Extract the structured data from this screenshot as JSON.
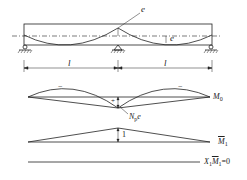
{
  "diagram": {
    "type": "prestressed-continuous-beam-moment-diagrams",
    "colors": {
      "stroke": "#222222",
      "background": "#ffffff"
    },
    "beam": {
      "eccentricity_label_top": "e",
      "eccentricity_label_span": "e",
      "supports": 3,
      "span_labels": [
        "l",
        "l"
      ]
    },
    "m0_diagram": {
      "label_main": "M",
      "label_sub": "0",
      "sign_negative_left": "−",
      "sign_negative_right": "−",
      "sign_positive": "+",
      "peak_label_main": "N",
      "peak_label_sub": "p",
      "peak_label_tail": "e"
    },
    "m1_diagram": {
      "label_main": "M",
      "label_sub": "1",
      "peak_value": "1"
    },
    "product_line": {
      "label_x": "X",
      "label_x_sub": "1",
      "label_m": "M",
      "label_m_sub": "1",
      "label_tail": "=0"
    }
  }
}
